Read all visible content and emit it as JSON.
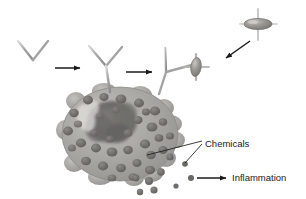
{
  "diagram": {
    "type": "biology-illustration",
    "background_color": "#ffffff",
    "palette": {
      "antibody_stroke": "#9a9a9a",
      "antibody_highlight": "#cfcfcf",
      "arrow_color": "#1a1a1a",
      "allergen_fill": "#8d8d8d",
      "allergen_edge": "#5e5e5e",
      "cell_fill": "#a8a6a3",
      "cell_edge": "#8d8b88",
      "granule_fill": "#6f6d6b",
      "nucleus_fill": "#5a5856",
      "label_color": "#1a1a1a"
    },
    "labels": [
      {
        "id": "chemicals",
        "text": "Chemicals",
        "x": 205,
        "y": 144,
        "anchor": "start"
      },
      {
        "id": "inflammation",
        "text": "Inflammation",
        "x": 232,
        "y": 178,
        "anchor": "start"
      }
    ],
    "arrows": [
      {
        "id": "arrow-1",
        "from": [
          55,
          68
        ],
        "to": [
          82,
          68
        ],
        "label": ""
      },
      {
        "id": "arrow-2",
        "from": [
          126,
          72
        ],
        "to": [
          154,
          72
        ],
        "label": ""
      },
      {
        "id": "arrow-allergen",
        "from": [
          250,
          41
        ],
        "to": [
          224,
          59
        ],
        "label": ""
      },
      {
        "id": "arrow-inflammation",
        "from": [
          197,
          178
        ],
        "to": [
          228,
          178
        ],
        "label": ""
      }
    ],
    "antibodies": [
      {
        "id": "antibody-free",
        "label": "free IgE antibody",
        "x": 33,
        "y": 60
      },
      {
        "id": "antibody-bound",
        "label": "IgE bound to mast cell",
        "x": 105,
        "y": 65
      },
      {
        "id": "antibody-allergen",
        "label": "IgE with allergen bound",
        "x": 172,
        "y": 70
      }
    ],
    "allergens": [
      {
        "id": "allergen-free",
        "label": "allergen particle",
        "x": 258,
        "y": 24
      },
      {
        "id": "allergen-bound",
        "label": "allergen bound to antibody",
        "x": 196,
        "y": 67
      }
    ],
    "cell": {
      "id": "mast-cell",
      "label": "mast cell",
      "center_x": 120,
      "center_y": 134,
      "radius_x": 58,
      "radius_y": 47,
      "granule_count": 34
    },
    "released_granules": [
      {
        "x": 170,
        "y": 157
      },
      {
        "x": 161,
        "y": 172
      },
      {
        "x": 149,
        "y": 180
      },
      {
        "x": 137,
        "y": 177
      },
      {
        "x": 155,
        "y": 190
      },
      {
        "x": 141,
        "y": 192
      },
      {
        "x": 185,
        "y": 164
      },
      {
        "x": 190,
        "y": 178
      },
      {
        "x": 176,
        "y": 186
      }
    ],
    "leader_lines": [
      {
        "id": "leader-cell-surface",
        "from": [
          147,
          155
        ],
        "to": [
          202,
          141
        ]
      },
      {
        "id": "leader-granule",
        "from": [
          185,
          164
        ],
        "to": [
          202,
          145
        ]
      }
    ]
  }
}
